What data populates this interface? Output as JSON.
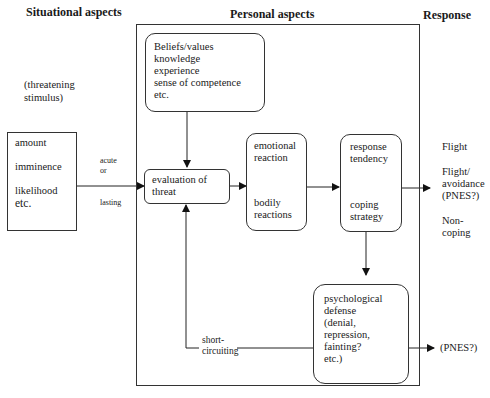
{
  "headers": {
    "situational": "Situational aspects",
    "personal": "Personal aspects",
    "response": "Response"
  },
  "situational": {
    "stimulus_line1": "(threatening",
    "stimulus_line2": "stimulus)",
    "box_items": [
      "amount",
      "imminence",
      "likelihood",
      "etc."
    ],
    "acute": "acute",
    "or": "or",
    "lasting": "lasting"
  },
  "personal": {
    "beliefs_lines": [
      "Beliefs/values",
      "knowledge",
      "experience",
      "sense of competence",
      "etc."
    ],
    "evaluation_lines": [
      "evaluation of",
      "threat"
    ],
    "emotional_lines": [
      "emotional",
      "reaction"
    ],
    "bodily_lines": [
      "bodily",
      "reactions"
    ],
    "response_tendency_lines": [
      "response",
      "tendency"
    ],
    "coping_lines": [
      "coping",
      "strategy"
    ],
    "defense_lines": [
      "psychological",
      "defense",
      "(denial,",
      "repression,",
      "fainting?",
      "etc.)"
    ],
    "short_circuit_lines": [
      "short-",
      "circuiting"
    ]
  },
  "response": {
    "flight": "Flight",
    "flight_avoidance_lines": [
      "Flight/",
      "avoidance",
      "(PNES?)"
    ],
    "noncoping_lines": [
      "Non-",
      "coping"
    ],
    "pnes": "(PNES?)"
  }
}
